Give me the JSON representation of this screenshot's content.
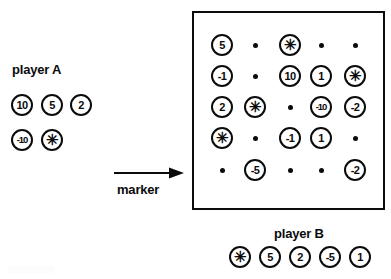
{
  "figure": {
    "ink_color": "#0b0b0b",
    "background_color": "#ffffff"
  },
  "player_a": {
    "label": "player A",
    "rows": [
      [
        {
          "value": "10",
          "kind": "number"
        },
        {
          "value": "5",
          "kind": "number"
        },
        {
          "value": "2",
          "kind": "number"
        }
      ],
      [
        {
          "value": "-10",
          "kind": "number"
        },
        {
          "value": "✳",
          "kind": "star"
        }
      ]
    ]
  },
  "player_b": {
    "label": "player B",
    "tokens": [
      {
        "value": "✳",
        "kind": "star"
      },
      {
        "value": "5",
        "kind": "number"
      },
      {
        "value": "2",
        "kind": "number"
      },
      {
        "value": "-5",
        "kind": "number"
      },
      {
        "value": "1",
        "kind": "number"
      }
    ]
  },
  "marker": {
    "label": "marker",
    "arrow_direction": "right"
  },
  "board": {
    "rows": 5,
    "cols": 5,
    "cells": [
      [
        {
          "value": "5",
          "kind": "number"
        },
        {
          "value": "",
          "kind": "dot"
        },
        {
          "value": "✳",
          "kind": "star"
        },
        {
          "value": "",
          "kind": "dot"
        },
        {
          "value": "",
          "kind": "dot"
        }
      ],
      [
        {
          "value": "-1",
          "kind": "number"
        },
        {
          "value": "",
          "kind": "dot"
        },
        {
          "value": "10",
          "kind": "number"
        },
        {
          "value": "1",
          "kind": "number"
        },
        {
          "value": "✳",
          "kind": "star"
        }
      ],
      [
        {
          "value": "2",
          "kind": "number"
        },
        {
          "value": "✳",
          "kind": "star"
        },
        {
          "value": "",
          "kind": "dot"
        },
        {
          "value": "-10",
          "kind": "number"
        },
        {
          "value": "-2",
          "kind": "number"
        }
      ],
      [
        {
          "value": "✳",
          "kind": "star"
        },
        {
          "value": "",
          "kind": "dot"
        },
        {
          "value": "-1",
          "kind": "number"
        },
        {
          "value": "1",
          "kind": "number"
        },
        {
          "value": "",
          "kind": "dot"
        }
      ],
      [
        {
          "value": "",
          "kind": "dot"
        },
        {
          "value": "-5",
          "kind": "number"
        },
        {
          "value": "",
          "kind": "dot"
        },
        {
          "value": "",
          "kind": "dot"
        },
        {
          "value": "-2",
          "kind": "number"
        }
      ]
    ]
  },
  "layout": {
    "board_col_x": [
      222,
      255,
      290,
      321,
      355
    ],
    "board_row_y": [
      45,
      76,
      107,
      138,
      170
    ],
    "player_a_col_x": [
      22,
      52,
      81
    ],
    "player_a_row_y": [
      105,
      140
    ],
    "player_b_col_x": [
      240,
      270,
      300,
      330,
      360
    ],
    "player_b_row_y": 257
  }
}
